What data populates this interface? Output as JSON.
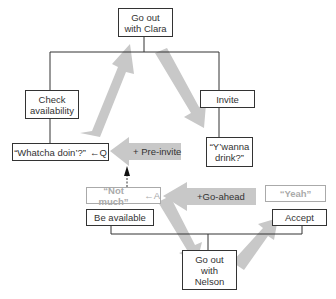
{
  "diagram": {
    "nodes": {
      "go_out_clara": "Go out\nwith Clara",
      "check_availability": "Check\navailability",
      "invite": "Invite",
      "whatcha_doin": "“Whatcha doin’?”",
      "whatcha_suffix": "←Q",
      "ywanna_drink": "“Y’wanna\ndrink?”",
      "not_much": "“Not much”",
      "not_much_suffix": "←A",
      "yeah": "“Yeah”",
      "be_available": "Be available",
      "accept": "Accept",
      "go_out_nelson": "Go out\nwith\nNelson"
    },
    "arrows": {
      "pre_invite": "+ Pre-invite",
      "go_ahead": "+Go-ahead"
    },
    "colors": {
      "line": "#333333",
      "big_arrow": "#c8c8c8",
      "faded_text": "#aaaaaa"
    }
  }
}
